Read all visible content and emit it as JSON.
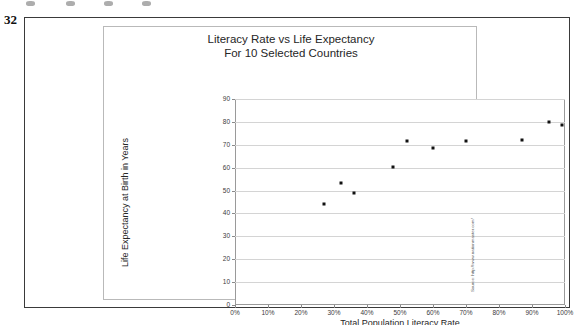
{
  "page": {
    "number": "32"
  },
  "chart": {
    "title_line1": "Literacy Rate vs Life Expectancy",
    "title_line2": "For 10 Selected Countries",
    "source_note": "Source: http://www.nationmaster.com/"
  },
  "chart_data": {
    "type": "scatter",
    "title": "Literacy Rate vs Life Expectancy For 10 Selected Countries",
    "xlabel": "Total Population Literacy Rate",
    "ylabel": "Life Expectancy at Birth in Years",
    "xlim": [
      0,
      100
    ],
    "ylim": [
      0,
      90
    ],
    "grid": true,
    "legend": false,
    "xticks": [
      "0%",
      "10%",
      "20%",
      "30%",
      "40%",
      "50%",
      "60%",
      "70%",
      "80%",
      "90%",
      "100%"
    ],
    "xtick_values": [
      0,
      10,
      20,
      30,
      40,
      50,
      60,
      70,
      80,
      90,
      100
    ],
    "yticks": [
      "0",
      "10",
      "20",
      "30",
      "40",
      "50",
      "60",
      "70",
      "80",
      "90"
    ],
    "ytick_values": [
      0,
      10,
      20,
      30,
      40,
      50,
      60,
      70,
      80,
      90
    ],
    "marker_color": "#111111",
    "points": [
      {
        "x": 27,
        "y": 44.0
      },
      {
        "x": 32,
        "y": 53.5
      },
      {
        "x": 36,
        "y": 49.0
      },
      {
        "x": 48,
        "y": 60.5
      },
      {
        "x": 52,
        "y": 71.5
      },
      {
        "x": 60,
        "y": 68.5
      },
      {
        "x": 70,
        "y": 71.8
      },
      {
        "x": 87,
        "y": 72.3
      },
      {
        "x": 95,
        "y": 80.0
      },
      {
        "x": 99,
        "y": 78.8
      }
    ]
  }
}
